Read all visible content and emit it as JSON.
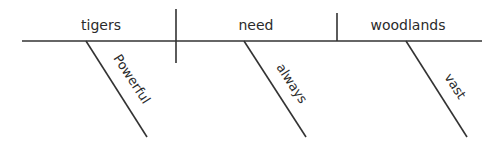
{
  "diagram": {
    "type": "sentence-diagram",
    "sentence": "Powerful tigers always need vast woodlands",
    "subject": "tigers",
    "verb": "need",
    "direct_object": "woodlands",
    "modifiers": [
      {
        "word": "Powerful",
        "modifies": "tigers"
      },
      {
        "word": "always",
        "modifies": "need"
      },
      {
        "word": "vast",
        "modifies": "woodlands"
      }
    ],
    "colors": {
      "line": "#333333",
      "text": "#2b2b2b",
      "background": "#ffffff"
    }
  }
}
